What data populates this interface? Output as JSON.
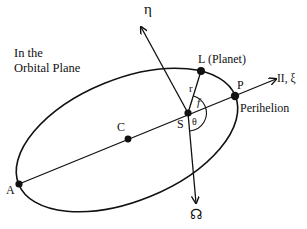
{
  "diagram": {
    "title_line1": "In the",
    "title_line2": "Orbital Plane",
    "points": {
      "A": {
        "label": "A",
        "x": 19,
        "y": 184
      },
      "C": {
        "label": "C",
        "x": 128,
        "y": 139
      },
      "S": {
        "label": "S",
        "x": 188,
        "y": 113
      },
      "P": {
        "label": "P",
        "x": 235,
        "y": 96
      },
      "L": {
        "label": "L (Planet)",
        "x": 201,
        "y": 71
      }
    },
    "axes": {
      "xi_label": "II, ξ",
      "eta_label": "η",
      "node_label": "☊"
    },
    "annotations": {
      "perihelion": "Perihelion",
      "radius": "r",
      "true_anomaly": "f",
      "angle_theta": "θ"
    },
    "ellipse": {
      "cx": 127,
      "cy": 140,
      "rx": 117,
      "ry": 61,
      "rotation_deg": -22.2
    },
    "colors": {
      "stroke": "#111111",
      "background": "#ffffff"
    }
  }
}
